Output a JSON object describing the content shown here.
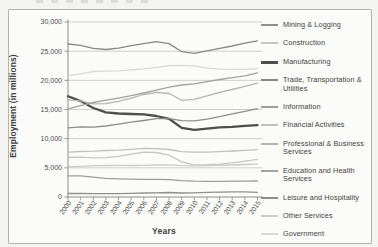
{
  "chart_data": {
    "type": "line",
    "title": "",
    "xlabel": "Years",
    "ylabel": "Employment (in millions)",
    "x": [
      2000,
      2001,
      2002,
      2003,
      2004,
      2005,
      2006,
      2007,
      2008,
      2009,
      2010,
      2011,
      2012,
      2013,
      2014,
      2015
    ],
    "ylim": [
      0,
      30000
    ],
    "ytick_step": 5000,
    "ytick_labels": [
      "0",
      "5,000",
      "10,000",
      "15,000",
      "20,000",
      "25,000",
      "30,000"
    ],
    "grid": true,
    "legend_position": "right",
    "axis_color": "#8c8c8a",
    "grid_color": "#c9c9c7",
    "tick_label_color": "#4c4c4a",
    "series": [
      {
        "name": "Mining & Logging",
        "color": "#8f8f8f",
        "thick": false,
        "values": [
          599,
          606,
          583,
          572,
          591,
          628,
          684,
          724,
          767,
          694,
          705,
          788,
          848,
          868,
          883,
          813
        ]
      },
      {
        "name": "Construction",
        "color": "#c6c6c4",
        "thick": false,
        "values": [
          6787,
          6826,
          6716,
          6735,
          6976,
          7336,
          7691,
          7630,
          7162,
          6016,
          5518,
          5533,
          5646,
          5856,
          6151,
          6460
        ]
      },
      {
        "name": "Manufacturing",
        "color": "#4e4e4e",
        "thick": true,
        "values": [
          17263,
          16441,
          15259,
          14510,
          14315,
          14227,
          14155,
          13879,
          13403,
          11847,
          11528,
          11726,
          11927,
          12020,
          12185,
          12333
        ]
      },
      {
        "name": "Trade, Transportation & Utilities",
        "color": "#888888",
        "thick": false,
        "values": [
          26225,
          25983,
          25497,
          25287,
          25533,
          25959,
          26276,
          26630,
          26293,
          24906,
          24636,
          25065,
          25476,
          25885,
          26373,
          26771
        ]
      },
      {
        "name": "Information",
        "color": "#9d9d9b",
        "thick": false,
        "values": [
          3630,
          3629,
          3395,
          3188,
          3118,
          3061,
          3038,
          3032,
          2984,
          2804,
          2707,
          2674,
          2676,
          2706,
          2726,
          2750
        ]
      },
      {
        "name": "Financial Activities",
        "color": "#c0c0be",
        "thick": false,
        "values": [
          7687,
          7808,
          7847,
          7977,
          8031,
          8153,
          8328,
          8301,
          8145,
          7769,
          7695,
          7697,
          7784,
          7886,
          7980,
          8123
        ]
      },
      {
        "name": "Professional & Business Services",
        "color": "#b4b4b2",
        "thick": false,
        "values": [
          16666,
          16476,
          15976,
          15987,
          16394,
          16954,
          17566,
          17942,
          17735,
          16579,
          16728,
          17332,
          17932,
          18420,
          18971,
          19517
        ]
      },
      {
        "name": "Education and Health Services",
        "color": "#a2a2a0",
        "thick": false,
        "values": [
          15109,
          15645,
          16199,
          16588,
          16953,
          17372,
          17826,
          18322,
          18838,
          19193,
          19414,
          19766,
          20147,
          20454,
          20774,
          21283
        ]
      },
      {
        "name": "Leisure and Hospitality",
        "color": "#8c8c8a",
        "thick": false,
        "values": [
          11862,
          12036,
          11986,
          12173,
          12493,
          12816,
          13110,
          13427,
          13436,
          13077,
          13049,
          13353,
          13768,
          14254,
          14696,
          15160
        ]
      },
      {
        "name": "Other Services",
        "color": "#cbcbc9",
        "thick": false,
        "values": [
          5168,
          5258,
          5372,
          5401,
          5409,
          5395,
          5438,
          5494,
          5515,
          5367,
          5331,
          5360,
          5430,
          5483,
          5566,
          5622
        ]
      },
      {
        "name": "Government",
        "color": "#d8d8d6",
        "thick": false,
        "values": [
          20790,
          21118,
          21513,
          21583,
          21621,
          21804,
          21974,
          22218,
          22509,
          22555,
          22490,
          22086,
          21920,
          21877,
          21880,
          22030
        ]
      }
    ]
  }
}
